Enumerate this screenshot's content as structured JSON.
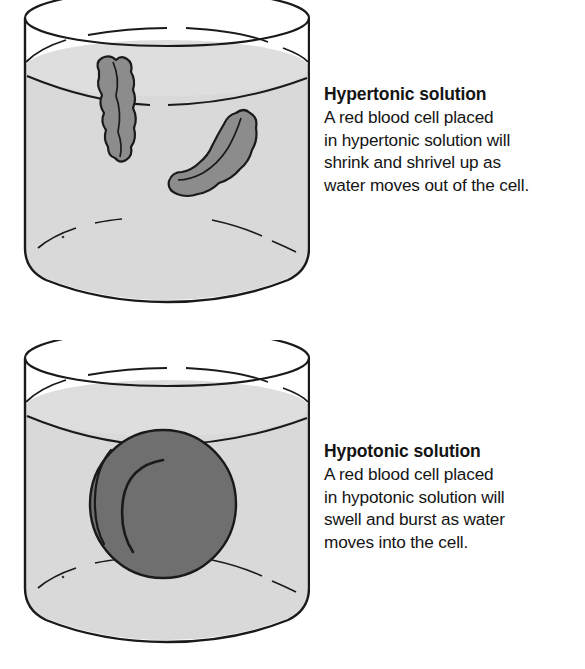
{
  "figure": {
    "title_visible": false,
    "colors": {
      "background": "#ffffff",
      "outline": "#1a1a1a",
      "water_fill": "#d9d9d9",
      "water_fill_upper": "#e0e0e0",
      "shriveled_cell_fill": "#8c8c8c",
      "swollen_cell_fill": "#6f6f6f",
      "text": "#141414"
    }
  },
  "panels": [
    {
      "id": "hypertonic",
      "beaker": {
        "name": "beaker-hypertonic",
        "liquid_label": "hypertonic solution",
        "cells": [
          {
            "name": "shriveled-cell-1",
            "state": "shriveled"
          },
          {
            "name": "shriveled-cell-2",
            "state": "shriveled"
          }
        ]
      },
      "text": {
        "heading": "Hypertonic solution",
        "lines": [
          "A red blood cell placed",
          "in hypertonic solution will",
          "shrink and shrivel up as",
          "water moves out of the cell."
        ]
      }
    },
    {
      "id": "hypotonic",
      "beaker": {
        "name": "beaker-hypotonic",
        "liquid_label": "hypotonic solution",
        "cells": [
          {
            "name": "swollen-cell-1",
            "state": "swollen"
          }
        ]
      },
      "text": {
        "heading": "Hypotonic solution",
        "lines": [
          "A red blood cell placed",
          "in hypotonic solution will",
          "swell and burst as water",
          "moves into the cell."
        ]
      }
    }
  ]
}
